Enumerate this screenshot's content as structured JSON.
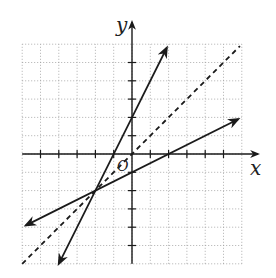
{
  "chart_data": {
    "type": "line",
    "title": "",
    "xlabel": "x",
    "ylabel": "y",
    "origin_label": "O",
    "xlim": [
      -6,
      6
    ],
    "ylim": [
      -6,
      6
    ],
    "grid": true,
    "grid_style": "dotted",
    "tick_spacing": 1,
    "series": [
      {
        "name": "y = 2x + 2",
        "style": "solid",
        "arrows": "both",
        "slope": 2,
        "intercept": 2,
        "x": [
          -4,
          1.9
        ],
        "y": [
          -6,
          5.8
        ]
      },
      {
        "name": "y = x/2 - 1",
        "style": "solid",
        "arrows": "both",
        "slope": 0.5,
        "intercept": -1,
        "x": [
          -5.8,
          5.8
        ],
        "y": [
          -3.9,
          1.9
        ]
      },
      {
        "name": "y = x",
        "style": "dashed",
        "arrows": "none",
        "slope": 1,
        "intercept": 0,
        "x": [
          -6,
          5.9
        ],
        "y": [
          -6,
          5.9
        ]
      }
    ],
    "intersection": {
      "x": -2,
      "y": -2
    },
    "annotations": [
      "Lines are reflections of each other across y = x"
    ]
  },
  "labels": {
    "x_axis": "x",
    "y_axis": "y",
    "origin": "O"
  },
  "colors": {
    "line": "#1a1a1a",
    "grid": "#9a9a9a",
    "axis": "#1a1a1a"
  }
}
